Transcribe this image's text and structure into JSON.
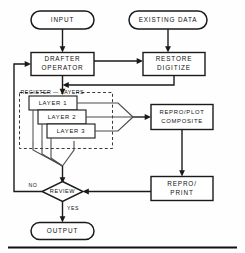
{
  "diagram": {
    "nodes": {
      "input": {
        "label": "INPUT",
        "shape": "terminator"
      },
      "existing_data": {
        "label": "EXISTING DATA",
        "shape": "terminator"
      },
      "drafter_operator": {
        "label_line1": "DRAFTER",
        "label_line2": "OPERATOR",
        "shape": "process"
      },
      "restore_digitize": {
        "label_line1": "RESTORE",
        "label_line2": "DIGITIZE",
        "shape": "process"
      },
      "register_layers": {
        "label": "REGISTER — LAYERS",
        "shape": "group-dashed"
      },
      "layer_1": {
        "label": "LAYER 1",
        "shape": "process"
      },
      "layer_2": {
        "label": "LAYER 2",
        "shape": "process"
      },
      "layer_3": {
        "label": "LAYER 3",
        "shape": "process"
      },
      "repro_plot_composite": {
        "label_line1": "REPRO/PLOT",
        "label_line2": "COMPOSITE",
        "shape": "process"
      },
      "repro_print": {
        "label_line1": "REPRO/",
        "label_line2": "PRINT",
        "shape": "process"
      },
      "review": {
        "label": "REVIEW",
        "shape": "decision"
      },
      "output": {
        "label": "OUTPUT",
        "shape": "terminator"
      }
    },
    "edge_labels": {
      "review_no": "NO",
      "review_yes": "YES"
    },
    "colors": {
      "stroke": "#1a1a1a",
      "dashed_stroke": "#3a3a3a",
      "thin_stroke": "#4a4a4a",
      "background": "#fefefe",
      "text": "#111111"
    }
  }
}
